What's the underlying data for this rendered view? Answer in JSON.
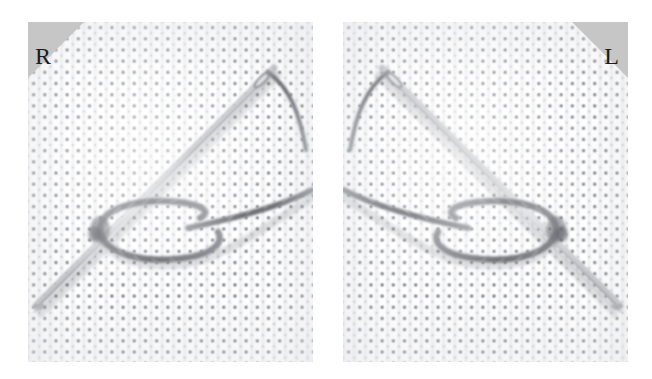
{
  "figure": {
    "background_color": "#ffffff",
    "width": 652,
    "height": 379
  },
  "panels": [
    {
      "id": "right-handed",
      "marker_label": "R",
      "marker_meaning": "right-handed",
      "marker_position": "top-left",
      "marker_color": "#c6c6c6",
      "marker_text_color": "#1b1b1b",
      "fabric": {
        "name": "aida-cloth",
        "color": "#fdfdfd",
        "hole_color": "#5a5c62",
        "weave_pitch_px": 11.2
      },
      "needle": {
        "name": "sewing-needle",
        "color": "#9a9ca2",
        "direction": "from lower-left to upper-right",
        "eye_position": "upper-right"
      },
      "thread": {
        "name": "embroidery-thread",
        "color": "#6f7178",
        "form": "twisted loop",
        "loop_orientation": "horizontal oval, centre-left"
      }
    },
    {
      "id": "left-handed",
      "marker_label": "L",
      "marker_meaning": "left-handed",
      "marker_position": "top-right",
      "marker_color": "#c6c6c6",
      "marker_text_color": "#1b1b1b",
      "fabric": {
        "name": "aida-cloth",
        "color": "#fdfdfd",
        "hole_color": "#5a5c62",
        "weave_pitch_px": 11.2
      },
      "needle": {
        "name": "sewing-needle",
        "color": "#9a9ca2",
        "direction": "from lower-right to upper-left",
        "eye_position": "upper-left"
      },
      "thread": {
        "name": "embroidery-thread",
        "color": "#6f7178",
        "form": "twisted loop",
        "loop_orientation": "horizontal oval, centre-right"
      }
    }
  ]
}
